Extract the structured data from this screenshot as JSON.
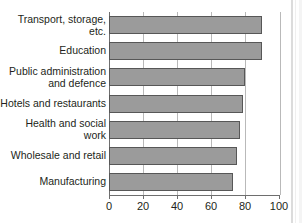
{
  "chart_data": {
    "type": "bar",
    "orientation": "horizontal",
    "title": "",
    "subtitle": "",
    "xlabel": "",
    "ylabel": "",
    "xlim": [
      0,
      100
    ],
    "ylim": null,
    "grid": false,
    "legend": null,
    "xticks": [
      0,
      20,
      40,
      60,
      80,
      100
    ],
    "xtick_labels": [
      "0",
      "20",
      "40",
      "60",
      "80",
      "100"
    ],
    "categories": [
      "Transport, storage,\netc.",
      "Education",
      "Public administration\nand defence",
      "Hotels and restaurants",
      "Health and social\nwork",
      "Wholesale and retail",
      "Manufacturing"
    ],
    "values": [
      90,
      90,
      80,
      79,
      77,
      75,
      73
    ],
    "bar_color": "#9b9b9b",
    "bar_edge_color": "#575757",
    "axis_color": "#6e6e6e",
    "gridline_color": "#b9b9b9",
    "text_color": "#231f20",
    "background": "#ffffff"
  },
  "axis": {
    "ticks": [
      {
        "value": 0,
        "label": "0"
      },
      {
        "value": 20,
        "label": "20"
      },
      {
        "value": 40,
        "label": "40"
      },
      {
        "value": 60,
        "label": "60"
      },
      {
        "value": 80,
        "label": "80"
      },
      {
        "value": 100,
        "label": "100"
      }
    ]
  },
  "bars": [
    {
      "label": "Transport, storage,\netc.",
      "value": 90
    },
    {
      "label": "Education",
      "value": 90
    },
    {
      "label": "Public administration\nand defence",
      "value": 80
    },
    {
      "label": "Hotels and restaurants",
      "value": 79
    },
    {
      "label": "Health and social\nwork",
      "value": 77
    },
    {
      "label": "Wholesale and retail",
      "value": 75
    },
    {
      "label": "Manufacturing",
      "value": 73
    }
  ]
}
